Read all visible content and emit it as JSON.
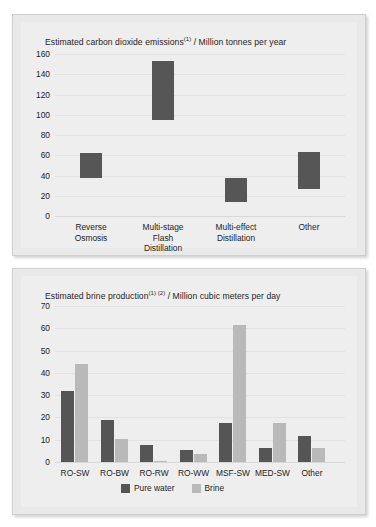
{
  "charts": [
    {
      "id": "co2",
      "title_main": "Estimated carbon dioxide emissions",
      "title_sup": "(1)",
      "title_tail": "/ Million tonnes per year"
    },
    {
      "id": "brine",
      "title_main": "Estimated brine production",
      "title_sup": "(1) (2)",
      "title_tail": "/ Million cubic meters per day"
    }
  ],
  "chart_data": [
    {
      "type": "bar",
      "subtype": "floating-range-bar",
      "title": "Estimated carbon dioxide emissions (1) / Million tonnes per year",
      "xlabel": "",
      "ylabel": "Million tonnes per year",
      "ylim": [
        0,
        160
      ],
      "yticks": [
        160,
        140,
        120,
        100,
        80,
        60,
        40,
        20,
        0
      ],
      "ytick_labels": [
        "160",
        "140",
        "120",
        "100",
        "80",
        "60",
        "40",
        "20",
        "0"
      ],
      "grid": true,
      "legend": "none",
      "bar_color": "#565656",
      "categories": [
        "Reverse Osmosis",
        "Multi-stage Flash Distillation",
        "Multi-effect Distillation",
        "Other"
      ],
      "category_lines": [
        [
          "Reverse",
          "Osmosis"
        ],
        [
          "Multi-stage",
          "Flash",
          "Distillation"
        ],
        [
          "Multi-effect",
          "Distillation"
        ],
        [
          "Other"
        ]
      ],
      "ranges": [
        {
          "category": "Reverse Osmosis",
          "low": 38,
          "high": 62
        },
        {
          "category": "Multi-stage Flash Distillation",
          "low": 95,
          "high": 153
        },
        {
          "category": "Multi-effect Distillation",
          "low": 14,
          "high": 38
        },
        {
          "category": "Other",
          "low": 27,
          "high": 63
        }
      ]
    },
    {
      "type": "bar",
      "subtype": "grouped",
      "title": "Estimated brine production (1) (2) / Million cubic meters per day",
      "xlabel": "",
      "ylabel": "Million cubic meters per day",
      "ylim": [
        0,
        70
      ],
      "yticks": [
        70,
        60,
        50,
        40,
        30,
        20,
        10,
        0
      ],
      "ytick_labels": [
        "70",
        "60",
        "50",
        "40",
        "30",
        "20",
        "10",
        "0"
      ],
      "grid": true,
      "legend_position": "bottom",
      "categories": [
        "RO-SW",
        "RO-BW",
        "RO-RW",
        "RO-WW",
        "MSF-SW",
        "MED-SW",
        "Other"
      ],
      "series": [
        {
          "name": "Pure water",
          "color": "#555555",
          "values": [
            32,
            19,
            7.5,
            5.5,
            17.5,
            6.5,
            11.5
          ]
        },
        {
          "name": "Brine",
          "color": "#b9b9b9",
          "values": [
            44,
            10.5,
            0.5,
            3.5,
            61.5,
            17.5,
            6.5
          ]
        }
      ]
    }
  ]
}
